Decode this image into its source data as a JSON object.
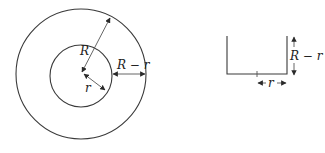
{
  "diagram": {
    "colors": {
      "stroke": "#3a3a3a",
      "text": "#222222",
      "background": "#ffffff"
    },
    "left_figure": {
      "description": "Concentric circles (annulus)",
      "outer_circle": {
        "cx": 81,
        "cy": 74,
        "r": 65
      },
      "inner_circle": {
        "cx": 81,
        "cy": 76,
        "r": 31
      },
      "labels": {
        "outer_radius": "R",
        "inner_radius": "r",
        "gap": "R − r"
      }
    },
    "right_figure": {
      "description": "Cross-section channel with dimensions",
      "labels": {
        "width": "r",
        "height": "R − r"
      }
    }
  }
}
